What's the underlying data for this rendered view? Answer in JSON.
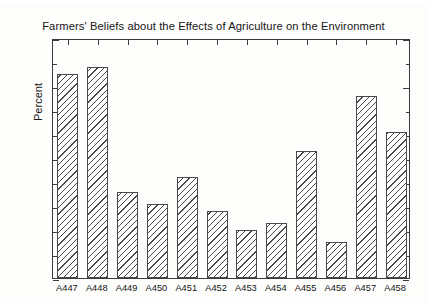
{
  "chart_data": {
    "type": "bar",
    "title": "Farmers' Beliefs about the Effects of Agriculture on the Environment",
    "xlabel": "",
    "ylabel": "Percent",
    "ylim": [
      0,
      100
    ],
    "ytick_labels": [
      "0",
      "20",
      "40",
      "60",
      "80",
      "100"
    ],
    "ytick_values": [
      0,
      20,
      40,
      60,
      80,
      100
    ],
    "yminor_step": 10,
    "grid": false,
    "legend": null,
    "categories": [
      "A447",
      "A448",
      "A449",
      "A450",
      "A451",
      "A452",
      "A453",
      "A454",
      "A455",
      "A456",
      "A457",
      "A458"
    ],
    "values": [
      85,
      88,
      36,
      31,
      42,
      28,
      20,
      23,
      53,
      15,
      76,
      61
    ],
    "bar_fill": "hatched-diagonal",
    "bar_edge_color": "#4a4a4a"
  }
}
